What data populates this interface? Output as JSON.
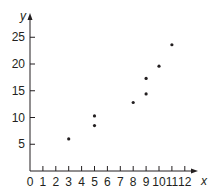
{
  "chart_data": {
    "type": "scatter",
    "title": "",
    "xlabel": "x",
    "ylabel": "y",
    "xlim": [
      0,
      12
    ],
    "ylim": [
      0,
      25
    ],
    "grid": false,
    "x_ticks": [
      0,
      1,
      2,
      3,
      4,
      5,
      6,
      7,
      8,
      9,
      10,
      11,
      12
    ],
    "y_ticks": [
      5,
      10,
      15,
      20,
      25
    ],
    "points": [
      {
        "x": 3,
        "y": 6
      },
      {
        "x": 5,
        "y": 8.5
      },
      {
        "x": 5,
        "y": 10.3
      },
      {
        "x": 8,
        "y": 12.8
      },
      {
        "x": 9,
        "y": 14.4
      },
      {
        "x": 9,
        "y": 17.3
      },
      {
        "x": 10,
        "y": 19.6
      },
      {
        "x": 11,
        "y": 23.6
      }
    ],
    "colors": {
      "axis": "#231f20",
      "point": "#231f20"
    }
  }
}
